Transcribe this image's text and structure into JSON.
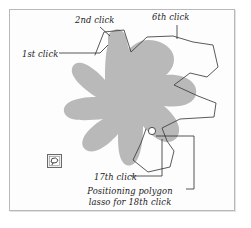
{
  "figure": {
    "type": "annotated-screenshot-diagram",
    "background_color": "#ffffff",
    "frame_border_color": "#b9b9b9",
    "blob_fill_color": "#b9b9b9",
    "lasso_stroke_color": "#3c3c3c",
    "leader_line_color": "#2b2b2b",
    "text_color": "#1b1b1b"
  },
  "annotations": {
    "first_click": "1st click",
    "second_click": "2nd click",
    "sixth_click": "6th click",
    "seventeenth_click": "17th click",
    "positioning_line1": "Positioning polygon",
    "positioning_line2": "lasso for 18th click"
  },
  "toolbar": {
    "lasso_tool_label": "polygon-lasso-tool"
  },
  "markers": {
    "click_point_17_label": "17th click vertex handle"
  }
}
